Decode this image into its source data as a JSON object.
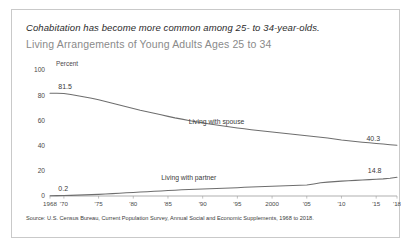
{
  "card": {
    "headline": "Cohabitation has become more common among 25- to 34-year-olds.",
    "subtitle": "Living Arrangements of Young Adults Ages 25 to 34",
    "source": "Source: U.S. Census Bureau, Current Population Survey, Annual Social and Economic Supplements, 1968 to 2018."
  },
  "chart_data": {
    "type": "line",
    "title": "Living Arrangements of Young Adults Ages 25 to 34",
    "xlabel": "",
    "ylabel": "Percent",
    "ylim": [
      0,
      100
    ],
    "xlim": [
      1968,
      2018
    ],
    "yticks": [
      "0",
      "20",
      "40",
      "60",
      "80",
      "100"
    ],
    "ytick_values": [
      0,
      20,
      40,
      60,
      80,
      100
    ],
    "xticks": [
      "1968",
      "'70",
      "'75",
      "'80",
      "'85",
      "'90",
      "'95",
      "2000",
      "'05",
      "'10",
      "'15",
      "'18"
    ],
    "xtick_values": [
      1968,
      1970,
      1975,
      1980,
      1985,
      1990,
      1995,
      2000,
      2005,
      2010,
      2015,
      2018
    ],
    "grid": false,
    "legend": "inline-labels",
    "line_color": "#6e6e6e",
    "x": [
      1968,
      1969,
      1970,
      1971,
      1972,
      1973,
      1974,
      1975,
      1976,
      1977,
      1978,
      1979,
      1980,
      1981,
      1982,
      1983,
      1984,
      1985,
      1986,
      1987,
      1988,
      1989,
      1990,
      1991,
      1992,
      1993,
      1994,
      1995,
      1996,
      1997,
      1998,
      1999,
      2000,
      2001,
      2002,
      2003,
      2004,
      2005,
      2006,
      2007,
      2008,
      2009,
      2010,
      2011,
      2012,
      2013,
      2014,
      2015,
      2016,
      2017,
      2018
    ],
    "series": [
      {
        "name": "Living with spouse",
        "label": "Living with spouse",
        "start_value": 81.5,
        "end_value": 40.3,
        "start_label": "81.5",
        "end_label": "40.3",
        "values": [
          81.5,
          81.5,
          81.4,
          80.6,
          79.6,
          78.6,
          77.6,
          76.4,
          75.0,
          73.6,
          72.2,
          70.8,
          69.4,
          68.0,
          66.8,
          65.6,
          64.4,
          63.2,
          62.0,
          61.0,
          60.0,
          59.0,
          58.2,
          57.2,
          56.4,
          55.6,
          54.8,
          54.0,
          53.3,
          52.6,
          52.0,
          51.4,
          50.8,
          50.2,
          49.6,
          49.0,
          48.4,
          47.8,
          47.2,
          46.6,
          46.0,
          45.2,
          44.4,
          43.8,
          43.2,
          42.7,
          42.2,
          41.7,
          41.2,
          40.7,
          40.3
        ]
      },
      {
        "name": "Living with partner",
        "label": "Living with partner",
        "start_value": 0.2,
        "end_value": 14.8,
        "start_label": "0.2",
        "end_label": "14.8",
        "values": [
          0.2,
          0.3,
          0.4,
          0.5,
          0.7,
          0.9,
          1.1,
          1.3,
          1.6,
          1.9,
          2.2,
          2.5,
          2.8,
          3.1,
          3.4,
          3.7,
          4.0,
          4.3,
          4.6,
          4.9,
          5.2,
          5.4,
          5.6,
          5.8,
          6.0,
          6.2,
          6.4,
          6.6,
          6.9,
          7.1,
          7.3,
          7.5,
          7.7,
          7.9,
          8.1,
          8.3,
          8.5,
          8.8,
          9.6,
          10.5,
          11.0,
          11.4,
          11.8,
          12.1,
          12.4,
          12.7,
          13.0,
          13.3,
          13.6,
          14.1,
          14.8
        ]
      }
    ],
    "annotations": [
      {
        "text": "81.5",
        "series": "Living with spouse",
        "position": "start"
      },
      {
        "text": "40.3",
        "series": "Living with spouse",
        "position": "end"
      },
      {
        "text": "0.2",
        "series": "Living with partner",
        "position": "start"
      },
      {
        "text": "14.8",
        "series": "Living with partner",
        "position": "end"
      }
    ]
  }
}
